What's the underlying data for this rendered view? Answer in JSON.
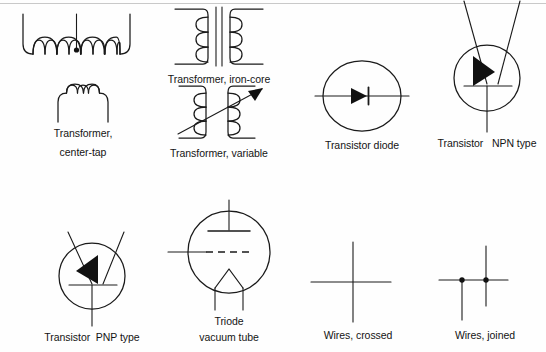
{
  "page": {
    "background_color": "#fefefe",
    "ink_color": "#1a1a1a",
    "width": 546,
    "height": 352
  },
  "symbols": [
    {
      "id": "transformer-center-tap-winding",
      "caption": "",
      "caption_lines": [],
      "row": 1,
      "column": 1,
      "type": "coil-with-center-tap",
      "coil_turns": 8,
      "has_center_tap_dot": true
    },
    {
      "id": "transformer-iron-core",
      "caption": "Transformer, iron-core",
      "caption_lines": [
        "Transformer, iron-core"
      ],
      "row": 1,
      "column": 2,
      "type": "two-coils-with-core",
      "coil_turns": 3,
      "core_lines": 2
    },
    {
      "id": "transistor-diode",
      "caption": "Transistor diode",
      "caption_lines": [
        "Transistor diode"
      ],
      "row": 1,
      "column": 3,
      "type": "diode-in-circle",
      "arrow_direction": "right",
      "has_cathode_bar": true
    },
    {
      "id": "transistor-npn",
      "caption": "Transistor   NPN type",
      "caption_lines": [
        "Transistor   NPN type"
      ],
      "row": 1,
      "column": 4,
      "type": "bjt-in-circle",
      "polarity": "NPN",
      "arrow_direction": "up-left",
      "leads": 3
    },
    {
      "id": "transformer-center-tap",
      "caption": "Transformer, center-tap",
      "caption_lines": [
        "Transformer,",
        "center-tap"
      ],
      "row": 2,
      "column": 1,
      "type": "coil",
      "coil_turns": 3
    },
    {
      "id": "transformer-variable",
      "caption": "Transformer, variable",
      "caption_lines": [
        "Transformer, variable"
      ],
      "row": 2,
      "column": 2,
      "type": "two-coils-with-arrow",
      "coil_turns": 3,
      "arrow_direction": "up-right"
    },
    {
      "id": "transistor-pnp",
      "caption": "Transistor  PNP type",
      "caption_lines": [
        "Transistor  PNP type"
      ],
      "row": 3,
      "column": 1,
      "type": "bjt-in-circle",
      "polarity": "PNP",
      "arrow_direction": "down-left",
      "leads": 3
    },
    {
      "id": "triode-vacuum-tube",
      "caption": "Triode vacuum tube",
      "caption_lines": [
        "Triode",
        "vacuum tube"
      ],
      "row": 3,
      "column": 2,
      "type": "vacuum-tube",
      "elements": [
        "plate",
        "grid",
        "cathode-filament"
      ],
      "grid_style": "dashed"
    },
    {
      "id": "wires-crossed",
      "caption": "Wires, crossed",
      "caption_lines": [
        "Wires, crossed"
      ],
      "row": 3,
      "column": 3,
      "type": "wire-crossing",
      "junction_dots": 0
    },
    {
      "id": "wires-joined",
      "caption": "Wires, joined",
      "caption_lines": [
        "Wires, joined"
      ],
      "row": 3,
      "column": 4,
      "type": "wire-junction",
      "junction_dots": 2
    }
  ]
}
